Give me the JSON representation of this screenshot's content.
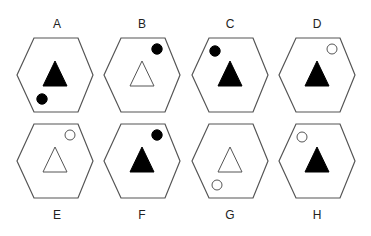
{
  "figure": {
    "options": [
      {
        "label": "A",
        "triangle": "filled",
        "circle": "filled",
        "circle_position": "bottom-left"
      },
      {
        "label": "B",
        "triangle": "outline",
        "circle": "filled",
        "circle_position": "top-right"
      },
      {
        "label": "C",
        "triangle": "filled",
        "circle": "filled",
        "circle_position": "top-left"
      },
      {
        "label": "D",
        "triangle": "filled",
        "circle": "outline",
        "circle_position": "top-right"
      },
      {
        "label": "E",
        "triangle": "outline",
        "circle": "outline",
        "circle_position": "top-right"
      },
      {
        "label": "F",
        "triangle": "filled",
        "circle": "filled",
        "circle_position": "top-right"
      },
      {
        "label": "G",
        "triangle": "outline",
        "circle": "outline",
        "circle_position": "bottom-left"
      },
      {
        "label": "H",
        "triangle": "filled",
        "circle": "outline",
        "circle_position": "top-left"
      }
    ],
    "colors": {
      "stroke": "#555555",
      "fill": "#000000",
      "background": "#ffffff"
    }
  }
}
